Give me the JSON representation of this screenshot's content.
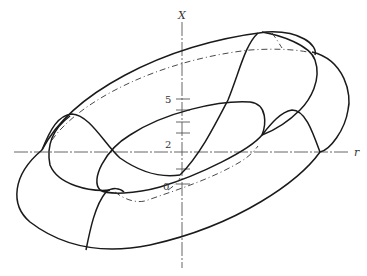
{
  "figure": {
    "type": "3D surface diagram (torus-like surface with cross-section curves)",
    "axes": {
      "vertical_label": "X",
      "horizontal_label": "r",
      "ticks": [
        {
          "label": "5",
          "value": 5
        },
        {
          "label": "2",
          "value": 2
        },
        {
          "label": "0",
          "value": 0
        }
      ]
    },
    "colors": {
      "line": "#1a1a1a",
      "axis": "#555555",
      "background": "#ffffff"
    }
  }
}
